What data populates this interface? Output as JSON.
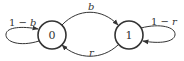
{
  "diagram": {
    "type": "markov-chain-state-diagram",
    "nodes": [
      {
        "id": "0",
        "label": "0",
        "cx": 52,
        "cy": 35,
        "r": 14
      },
      {
        "id": "1",
        "label": "1",
        "cx": 129,
        "cy": 35,
        "r": 14
      }
    ],
    "edges": [
      {
        "from": "0",
        "to": "0",
        "label_prefix": "1 − ",
        "label_var": "b",
        "kind": "self-loop-left"
      },
      {
        "from": "0",
        "to": "1",
        "label_var": "b",
        "kind": "arc-top"
      },
      {
        "from": "1",
        "to": "0",
        "label_var": "r",
        "kind": "arc-bottom"
      },
      {
        "from": "1",
        "to": "1",
        "label_prefix": "1 − ",
        "label_var": "r",
        "kind": "self-loop-right"
      }
    ],
    "colors": {
      "stroke": "#333333",
      "background": "#ffffff"
    }
  }
}
